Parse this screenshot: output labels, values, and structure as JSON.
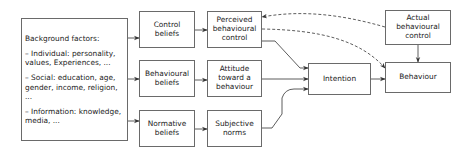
{
  "diagram": {
    "background": {
      "heading": "Background factors:",
      "lines": [
        "– Individual: personality, values, Experiences, ...",
        "– Social: education, age, gender, income, religion, ...",
        "– Information: knowledge, media, ..."
      ]
    },
    "nodes": {
      "control_beliefs": "Control beliefs",
      "behavioural_beliefs": "Behavioural beliefs",
      "normative_beliefs": "Normative beliefs",
      "perceived_control": "Perceived behavioural control",
      "attitude": "Attitude toward a behaviour",
      "subjective_norms": "Subjective norms",
      "intention": "Intention",
      "actual_control": "Actual behavioural control",
      "behaviour": "Behaviour"
    },
    "edges": [
      {
        "from": "background",
        "to": "control_beliefs",
        "style": "solid"
      },
      {
        "from": "background",
        "to": "behavioural_beliefs",
        "style": "solid"
      },
      {
        "from": "background",
        "to": "normative_beliefs",
        "style": "solid"
      },
      {
        "from": "control_beliefs",
        "to": "perceived_control",
        "style": "solid"
      },
      {
        "from": "behavioural_beliefs",
        "to": "attitude",
        "style": "solid"
      },
      {
        "from": "normative_beliefs",
        "to": "subjective_norms",
        "style": "solid"
      },
      {
        "from": "perceived_control",
        "to": "intention",
        "style": "solid"
      },
      {
        "from": "attitude",
        "to": "intention",
        "style": "solid"
      },
      {
        "from": "subjective_norms",
        "to": "intention",
        "style": "solid"
      },
      {
        "from": "intention",
        "to": "behaviour",
        "style": "solid"
      },
      {
        "from": "actual_control",
        "to": "behaviour",
        "style": "solid"
      },
      {
        "from": "actual_control",
        "to": "perceived_control",
        "style": "dashed"
      },
      {
        "from": "perceived_control",
        "to": "behaviour",
        "style": "dashed"
      }
    ],
    "colors": {
      "border": "#6a6a6a",
      "edge": "#333333",
      "background": "#ffffff"
    }
  }
}
